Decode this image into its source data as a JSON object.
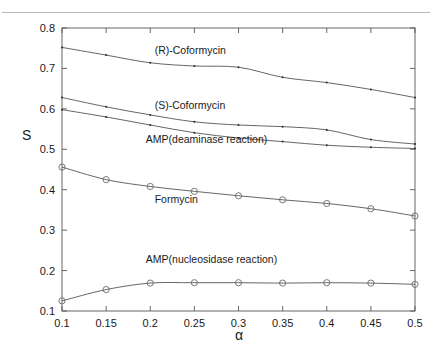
{
  "figure": {
    "top_artifact_fragments": [
      "·",
      "·"
    ],
    "colors": {
      "axis": "#555555",
      "curve": "#4a4a4a",
      "marker_dot": "#2b2b2b",
      "marker_circle": "#6b6b6b",
      "background": "#ffffff",
      "text": "#1a1a1a"
    }
  },
  "chart_data": {
    "type": "line",
    "title": "",
    "xlabel": "α",
    "ylabel": "S",
    "x": [
      0.1,
      0.15,
      0.2,
      0.25,
      0.3,
      0.35,
      0.4,
      0.45,
      0.5
    ],
    "xtick_labels": [
      "0.1",
      "0.15",
      "0.2",
      "0.25",
      "0.3",
      "0.35",
      "0.4",
      "0.45",
      "0.5"
    ],
    "ytick_labels": [
      "0.1",
      "0.2",
      "0.3",
      "0.4",
      "0.5",
      "0.6",
      "0.7",
      "0.8"
    ],
    "yticks": [
      0.1,
      0.2,
      0.3,
      0.4,
      0.5,
      0.6,
      0.7,
      0.8
    ],
    "xlim": [
      0.1,
      0.5
    ],
    "ylim": [
      0.1,
      0.8
    ],
    "grid": false,
    "legend_position": "inline-annotations",
    "series": [
      {
        "name": "(R)-Coformycin",
        "marker": "dot",
        "label_x": 0.205,
        "label_y": 0.735,
        "values": [
          0.752,
          0.733,
          0.714,
          0.706,
          0.703,
          0.678,
          0.665,
          0.648,
          0.628
        ]
      },
      {
        "name": "(S)-Coformycin",
        "marker": "dot",
        "label_x": 0.205,
        "label_y": 0.6,
        "values": [
          0.628,
          0.605,
          0.585,
          0.568,
          0.56,
          0.556,
          0.548,
          0.524,
          0.513
        ]
      },
      {
        "name": "AMP(deaminase reaction)",
        "marker": "dot",
        "label_x": 0.195,
        "label_y": 0.516,
        "values": [
          0.598,
          0.58,
          0.56,
          0.541,
          0.528,
          0.519,
          0.51,
          0.505,
          0.502
        ]
      },
      {
        "name": "Formycin",
        "marker": "circle",
        "label_x": 0.205,
        "label_y": 0.368,
        "values": [
          0.456,
          0.425,
          0.408,
          0.396,
          0.385,
          0.375,
          0.366,
          0.353,
          0.335
        ]
      },
      {
        "name": "AMP(nucleosidase reaction)",
        "marker": "circle",
        "label_x": 0.195,
        "label_y": 0.218,
        "values": [
          0.125,
          0.153,
          0.169,
          0.17,
          0.17,
          0.169,
          0.17,
          0.169,
          0.166
        ]
      }
    ]
  }
}
